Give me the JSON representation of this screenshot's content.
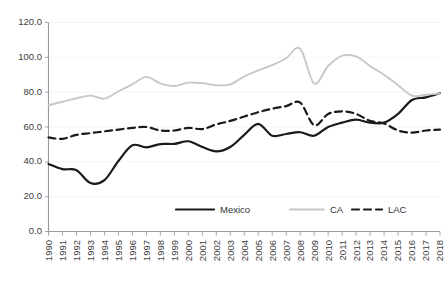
{
  "chart_data": {
    "type": "line",
    "title": "",
    "subtitle": "",
    "xlabel": "",
    "ylabel": "",
    "grid": false,
    "legend_position": "bottom-inside",
    "ylim": [
      0.0,
      120.0
    ],
    "ytick_labels": [
      "120.0",
      "100.0",
      "80.0",
      "60.0",
      "40.0",
      "20.0",
      "0.0"
    ],
    "ytick_values": [
      120.0,
      100.0,
      80.0,
      60.0,
      40.0,
      20.0,
      0.0
    ],
    "x": [
      1990,
      1991,
      1992,
      1993,
      1994,
      1995,
      1996,
      1997,
      1998,
      1999,
      2000,
      2001,
      2002,
      2003,
      2004,
      2005,
      2006,
      2007,
      2008,
      2009,
      2010,
      2011,
      2012,
      2013,
      2014,
      2015,
      2016,
      2017,
      2018
    ],
    "categories": [
      "1990",
      "1991",
      "1992",
      "1993",
      "1994",
      "1995",
      "1996",
      "1997",
      "1998",
      "1999",
      "2000",
      "2001",
      "2002",
      "2003",
      "2004",
      "2005",
      "2006",
      "2007",
      "2008",
      "2009",
      "2010",
      "2011",
      "2012",
      "2013",
      "2014",
      "2015",
      "2016",
      "2017",
      "2018"
    ],
    "series": [
      {
        "name": "Mexico",
        "style": "solid",
        "color": "#1a1a1a",
        "width": 2.2,
        "values": [
          38.8,
          35.8,
          35.2,
          27.8,
          29.5,
          40.5,
          49.5,
          48.3,
          50.2,
          50.3,
          51.8,
          48.5,
          46.0,
          48.5,
          55.5,
          61.8,
          55.0,
          56.0,
          57.0,
          55.0,
          60.0,
          62.5,
          64.2,
          62.5,
          62.5,
          67.5,
          75.5,
          77.0,
          79.4
        ]
      },
      {
        "name": "CA",
        "style": "solid",
        "color": "#c8c8c8",
        "width": 1.9,
        "values": [
          72.5,
          74.5,
          76.5,
          78.0,
          76.3,
          80.5,
          84.5,
          88.8,
          85.0,
          83.5,
          85.5,
          85.2,
          84.0,
          84.5,
          89.0,
          92.5,
          95.5,
          99.5,
          105.0,
          85.0,
          95.0,
          101.0,
          100.5,
          95.0,
          90.0,
          84.0,
          78.0,
          78.5,
          79.2
        ]
      },
      {
        "name": "LAC",
        "style": "dashed",
        "color": "#1a1a1a",
        "width": 2.2,
        "values": [
          54.0,
          53.2,
          55.5,
          56.5,
          57.5,
          58.5,
          59.5,
          60.0,
          58.0,
          58.0,
          59.5,
          58.8,
          61.5,
          63.5,
          66.0,
          68.5,
          70.5,
          72.0,
          74.0,
          61.0,
          67.5,
          69.0,
          67.5,
          63.5,
          62.0,
          58.0,
          56.8,
          58.0,
          58.5
        ]
      }
    ]
  },
  "legend": {
    "items": [
      {
        "label": "Mexico",
        "swatch": "solid-black-line-swatch"
      },
      {
        "label": "CA",
        "swatch": "solid-gray-line-swatch"
      },
      {
        "label": "LAC",
        "swatch": "dashed-black-line-swatch"
      }
    ]
  },
  "colors": {
    "mexico": "#1a1a1a",
    "ca": "#c8c8c8",
    "lac": "#1a1a1a",
    "axis": "#9a9a9a",
    "text": "#404040",
    "background": "#ffffff"
  }
}
